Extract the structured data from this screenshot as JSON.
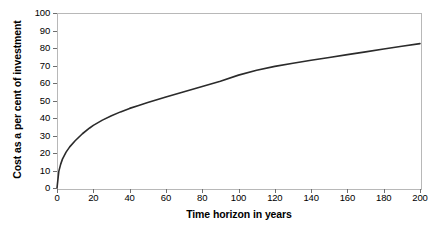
{
  "chart_data": {
    "type": "line",
    "title": "",
    "xlabel": "Time horizon in years",
    "ylabel": "Cost as a per cent of investment",
    "xlim": [
      0,
      200
    ],
    "ylim": [
      0,
      100
    ],
    "grid": false,
    "legend": null,
    "xticks": [
      0,
      20,
      40,
      60,
      80,
      100,
      120,
      140,
      160,
      180,
      200
    ],
    "xtick_labels": [
      "0",
      "20",
      "40",
      "60",
      "80",
      "100",
      "120",
      "140",
      "160",
      "180",
      "200"
    ],
    "yticks": [
      0,
      10,
      20,
      30,
      40,
      50,
      60,
      70,
      80,
      90,
      100
    ],
    "ytick_labels": [
      "0",
      "10",
      "20",
      "30",
      "40",
      "50",
      "60",
      "70",
      "80",
      "90",
      "100"
    ],
    "series": [
      {
        "name": "Cost as a per cent of investment",
        "color": "#2b2b2b",
        "x": [
          0,
          1,
          2,
          3,
          5,
          7,
          10,
          14,
          18,
          20,
          25,
          30,
          35,
          40,
          45,
          50,
          60,
          70,
          80,
          90,
          100,
          110,
          120,
          130,
          140,
          150,
          160,
          170,
          180,
          190,
          200
        ],
        "y": [
          0,
          9.5,
          13.5,
          16.5,
          20.5,
          23.5,
          27.0,
          31.0,
          34.3,
          35.8,
          38.8,
          41.3,
          43.5,
          45.5,
          47.2,
          48.8,
          52.0,
          55.0,
          58.0,
          61.0,
          64.5,
          67.3,
          69.5,
          71.3,
          73.0,
          74.6,
          76.2,
          77.8,
          79.4,
          81.0,
          82.5
        ]
      }
    ]
  },
  "axes": {
    "y_title": "Cost as a per cent of investment",
    "x_title": "Time horizon in years"
  },
  "style": {
    "line_color": "#2b2b2b",
    "frame_color": "#b8b8b8",
    "spine_color": "#6e6e6e",
    "background": "#ffffff"
  }
}
